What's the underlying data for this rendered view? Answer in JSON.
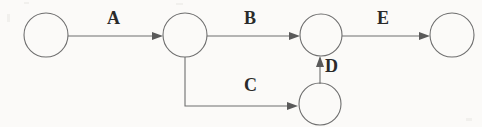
{
  "diagram": {
    "type": "directed-graph",
    "title": "",
    "background_color": "#fbfaf8",
    "stroke_color": "#6e6e6e",
    "label_color": "#2a2a2a",
    "nodes": [
      {
        "id": "n1",
        "label": "",
        "cx": 46,
        "cy": 35,
        "r": 22
      },
      {
        "id": "n2",
        "label": "",
        "cx": 185,
        "cy": 35,
        "r": 22
      },
      {
        "id": "n3",
        "label": "",
        "cx": 321,
        "cy": 35,
        "r": 21
      },
      {
        "id": "n4",
        "label": "",
        "cx": 452,
        "cy": 35,
        "r": 22
      },
      {
        "id": "n5",
        "label": "",
        "cx": 320,
        "cy": 104,
        "r": 21
      }
    ],
    "edges": [
      {
        "id": "e-a",
        "label": "A",
        "from": "n1",
        "to": "n2",
        "shape": "straight",
        "label_x": 107,
        "label_y": 9
      },
      {
        "id": "e-b",
        "label": "B",
        "from": "n2",
        "to": "n3",
        "shape": "straight",
        "label_x": 244,
        "label_y": 9
      },
      {
        "id": "e-e",
        "label": "E",
        "from": "n3",
        "to": "n4",
        "shape": "straight",
        "label_x": 377,
        "label_y": 9
      },
      {
        "id": "e-c",
        "label": "C",
        "from": "n2",
        "to": "n5",
        "shape": "elbow-down-right",
        "label_x": 244,
        "label_y": 76
      },
      {
        "id": "e-d",
        "label": "D",
        "from": "n5",
        "to": "n3",
        "shape": "vertical-up",
        "label_x": 325,
        "label_y": 57
      }
    ]
  }
}
